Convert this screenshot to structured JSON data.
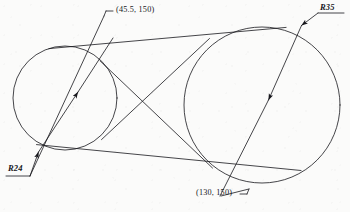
{
  "drawing": {
    "title": "Two-circle belt tangent construction",
    "background_color": "#fbfbfa",
    "line_color": "#17171c",
    "stroke_width": 0.8,
    "canvas": {
      "width": 350,
      "height": 212
    },
    "circles": [
      {
        "name": "small-circle",
        "label": "R24",
        "cx": 65,
        "cy": 98,
        "r": 52
      },
      {
        "name": "large-circle",
        "label": "R35",
        "cx": 262,
        "cy": 105,
        "r": 78
      }
    ],
    "labels": {
      "radius_small": "R24",
      "radius_large": "R35",
      "point_top": "(45.5, 150)",
      "point_bottom": "(130, 150)"
    },
    "label_positions": {
      "radius_small": {
        "x": 8,
        "y": 166
      },
      "radius_large": {
        "x": 305,
        "y": 7
      },
      "point_top": {
        "x": 116,
        "y": 8
      },
      "point_bottom": {
        "x": 196,
        "y": 190
      }
    }
  }
}
